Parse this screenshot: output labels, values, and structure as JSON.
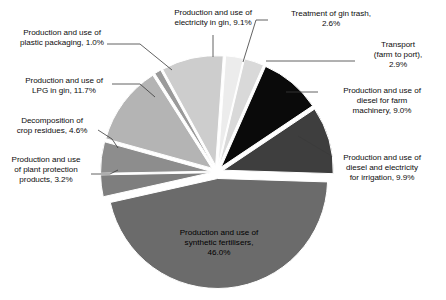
{
  "chart_data": {
    "type": "pie",
    "title": "",
    "subtitle": "",
    "xlabel": "",
    "ylabel": "",
    "units": "%",
    "legend_position": "none",
    "grid": false,
    "exploded": true,
    "center": {
      "x": 217,
      "y": 172
    },
    "radius": 110,
    "categories": [
      "Treatment of gin trash",
      "Transport (farm to port)",
      "Production and use of diesel for farm machinery",
      "Production and use of diesel and electricity for irrigation",
      "Production and use of synthetic fertilisers",
      "Production and use of plant protection products",
      "Decomposition of crop residues",
      "Production and use of LPG in gin",
      "Production and use of plastic packaging",
      "Production and use of electricity in gin"
    ],
    "values": [
      2.6,
      2.9,
      9.0,
      9.9,
      46.0,
      3.2,
      4.6,
      11.7,
      1.0,
      9.1
    ],
    "colors": [
      "#ececec",
      "#d9d9d9",
      "#0a0a0a",
      "#3e3e3e",
      "#6b6b6b",
      "#7e7e7e",
      "#8d8d8d",
      "#b4b4b4",
      "#9a9a9a",
      "#cdcdcd"
    ],
    "slices": [
      {
        "label": "Treatment of gin trash",
        "value": 2.6,
        "value_text": "2.6%",
        "color": "#ececec",
        "start_deg": 4.0,
        "end_deg": 13.4
      },
      {
        "label": "Transport (farm to port)",
        "value": 2.9,
        "value_text": "2.9%",
        "color": "#d9d9d9",
        "start_deg": 13.4,
        "end_deg": 23.8
      },
      {
        "label": "Production and use of diesel for farm machinery",
        "value": 9.0,
        "value_text": "9.0%",
        "color": "#0a0a0a",
        "start_deg": 23.8,
        "end_deg": 56.2
      },
      {
        "label": "Production and use of diesel and electricity for irrigation",
        "value": 9.9,
        "value_text": "9.9%",
        "color": "#3e3e3e",
        "start_deg": 56.2,
        "end_deg": 91.8
      },
      {
        "label": "Production and use of synthetic fertilisers",
        "value": 46.0,
        "value_text": "46.0%",
        "color": "#6b6b6b",
        "start_deg": 91.8,
        "end_deg": 257.4
      },
      {
        "label": "Production and use of plant protection products",
        "value": 3.2,
        "value_text": "3.2%",
        "color": "#7e7e7e",
        "start_deg": 257.4,
        "end_deg": 268.9
      },
      {
        "label": "Decomposition of crop residues",
        "value": 4.6,
        "value_text": "4.6%",
        "color": "#8d8d8d",
        "start_deg": 268.9,
        "end_deg": 285.5
      },
      {
        "label": "Production and use of LPG in gin",
        "value": 11.7,
        "value_text": "11.7%",
        "color": "#b4b4b4",
        "start_deg": 285.5,
        "end_deg": 327.6
      },
      {
        "label": "Production and use of plastic packaging",
        "value": 1.0,
        "value_text": "1.0%",
        "color": "#9a9a9a",
        "start_deg": 327.6,
        "end_deg": 331.2
      },
      {
        "label": "Production and use of electricity in gin",
        "value": 9.1,
        "value_text": "9.1%",
        "color": "#cdcdcd",
        "start_deg": 331.2,
        "end_deg": 364.0
      }
    ]
  },
  "labels": {
    "plastic_packaging": "Production and use of\nplastic packaging, 1.0%",
    "electricity_in_gin": "Production and use of\nelectricity in gin, 9.1%",
    "gin_trash": "Treatment of gin trash,\n2.6%",
    "transport": "Transport\n(farm to port),\n2.9%",
    "diesel_farm_machinery": "Production and use of\ndiesel for farm\nmachinery, 9.0%",
    "diesel_irrigation": "Production and use of\ndiesel and electricity\nfor irrigation, 9.9%",
    "lpg_in_gin": "Production and use of\nLPG in gin, 11.7%",
    "crop_residues": "Decomposition of\ncrop residues, 4.6%",
    "plant_protection": "Production and use\nof plant protection\nproducts, 3.2%",
    "synthetic_fertilisers_l1": "Production and use of",
    "synthetic_fertilisers_l2": "synthetic fertilisers,",
    "synthetic_fertilisers_l3": "46.0%"
  }
}
